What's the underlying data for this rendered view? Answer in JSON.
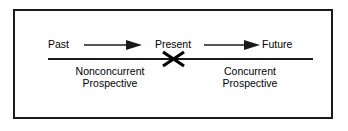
{
  "figure": {
    "border_color": "#1a1a1a",
    "background_color": "#ffffff",
    "line_color": "#1a1a1a"
  },
  "timeline": {
    "nodes": [
      {
        "id": "past",
        "label": "Past"
      },
      {
        "id": "present",
        "label": "Present"
      },
      {
        "id": "future",
        "label": "Future"
      }
    ],
    "arrows": [
      {
        "id": "past-to-present",
        "from": "Past",
        "to": "Present",
        "direction": "right"
      },
      {
        "id": "present-to-future",
        "from": "Present",
        "to": "Future",
        "direction": "right"
      }
    ],
    "marker": {
      "id": "present-cross",
      "icon": "x-cross-icon",
      "at": "Present"
    }
  },
  "regions": [
    {
      "id": "nonconcurrent",
      "line1": "Nonconcurrent",
      "line2": "Prospective",
      "side": "left"
    },
    {
      "id": "concurrent",
      "line1": "Concurrent",
      "line2": "Prospective",
      "side": "right"
    }
  ]
}
